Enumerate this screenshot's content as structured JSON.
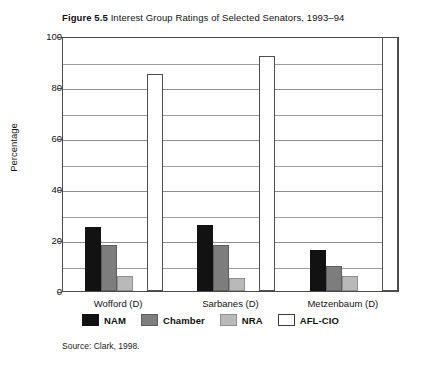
{
  "figure": {
    "number_label": "Figure 5.5",
    "title_text": "Interest Group Ratings of Selected Senators, 1993–94",
    "source": "Source:  Clark, 1998."
  },
  "colors": {
    "nam": "#121212",
    "chamber": "#7d7d7d",
    "nra": "#b9b9b9",
    "aflcio": "#ffffff",
    "frame": "#4a4a4a",
    "gridline": "#8c8c8c"
  },
  "chart_data": {
    "type": "bar",
    "title": "Interest Group Ratings of Selected Senators, 1993–94",
    "xlabel": "",
    "ylabel": "Percentage",
    "ylim": [
      0,
      100
    ],
    "yticks": [
      0,
      20,
      40,
      60,
      80,
      100
    ],
    "ytick_labels": [
      "0",
      "20",
      "40",
      "60",
      "80",
      "100"
    ],
    "minor_yticks": [
      10,
      30,
      50,
      70,
      90
    ],
    "grid": true,
    "legend_position": "bottom",
    "categories": [
      "Wofford (D)",
      "Sarbanes (D)",
      "Metzenbaum (D)"
    ],
    "series": [
      {
        "name": "NAM",
        "values": [
          25,
          26,
          16
        ]
      },
      {
        "name": "Chamber",
        "values": [
          18,
          18,
          10
        ]
      },
      {
        "name": "NRA",
        "values": [
          6,
          5,
          6
        ]
      },
      {
        "name": "AFL-CIO",
        "values": [
          85,
          92,
          100
        ]
      }
    ]
  }
}
